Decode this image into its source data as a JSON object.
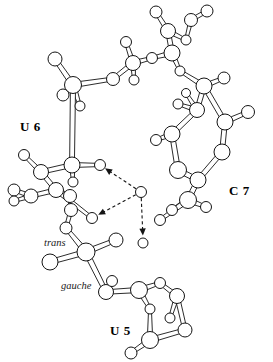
{
  "figure": {
    "kind": "molecular-structure-diagram",
    "style": "ball-and-stick ORTEP-like line drawing",
    "background_color": "#ffffff",
    "line_color": "#141414",
    "atom_fill_color": "#ffffff",
    "width": 273,
    "height": 362
  },
  "labels": {
    "residue_u6": "U 6",
    "residue_c7": "C 7",
    "residue_u5": "U 5",
    "conformer_trans": "trans",
    "conformer_gauche": "gauche"
  },
  "chart_data": {
    "type": "scatter",
    "title": "",
    "xlabel": "",
    "ylabel": "",
    "grid": false,
    "legend": false,
    "annotations": [
      {
        "text": "U 6",
        "x": 20,
        "y": 120,
        "style": "bold"
      },
      {
        "text": "C 7",
        "x": 229,
        "y": 184,
        "style": "bold"
      },
      {
        "text": "U 5",
        "x": 110,
        "y": 324,
        "style": "bold"
      },
      {
        "text": "trans",
        "x": 44,
        "y": 238,
        "style": "italic"
      },
      {
        "text": "gauche",
        "x": 61,
        "y": 281,
        "style": "italic"
      }
    ],
    "atoms": [
      {
        "id": "a1",
        "x": 55,
        "y": 59,
        "r": 7.0
      },
      {
        "id": "a2",
        "x": 73,
        "y": 85,
        "r": 8.5
      },
      {
        "id": "a3",
        "x": 63,
        "y": 95,
        "r": 6.0
      },
      {
        "id": "a4",
        "x": 80,
        "y": 106,
        "r": 5.0
      },
      {
        "id": "a5",
        "x": 113,
        "y": 79,
        "r": 6.5
      },
      {
        "id": "a6",
        "x": 133,
        "y": 63,
        "r": 7.5
      },
      {
        "id": "a7",
        "x": 126,
        "y": 42,
        "r": 5.5
      },
      {
        "id": "a8",
        "x": 134,
        "y": 80,
        "r": 5.0
      },
      {
        "id": "a9",
        "x": 152,
        "y": 58,
        "r": 5.5
      },
      {
        "id": "a10",
        "x": 172,
        "y": 53,
        "r": 8.0
      },
      {
        "id": "a11",
        "x": 168,
        "y": 31,
        "r": 7.5
      },
      {
        "id": "a12",
        "x": 156,
        "y": 12,
        "r": 6.0
      },
      {
        "id": "a13",
        "x": 186,
        "y": 40,
        "r": 5.0
      },
      {
        "id": "a14",
        "x": 191,
        "y": 20,
        "r": 6.5
      },
      {
        "id": "a15",
        "x": 207,
        "y": 11,
        "r": 6.0
      },
      {
        "id": "a16",
        "x": 180,
        "y": 71,
        "r": 5.0
      },
      {
        "id": "a17",
        "x": 204,
        "y": 86,
        "r": 8.0
      },
      {
        "id": "a18",
        "x": 224,
        "y": 78,
        "r": 6.0
      },
      {
        "id": "a19",
        "x": 197,
        "y": 110,
        "r": 7.5
      },
      {
        "id": "a20",
        "x": 178,
        "y": 104,
        "r": 5.0
      },
      {
        "id": "a21",
        "x": 186,
        "y": 93,
        "r": 4.5
      },
      {
        "id": "a22",
        "x": 225,
        "y": 122,
        "r": 8.0
      },
      {
        "id": "a23",
        "x": 248,
        "y": 112,
        "r": 6.5
      },
      {
        "id": "a24",
        "x": 172,
        "y": 134,
        "r": 8.0
      },
      {
        "id": "a25",
        "x": 156,
        "y": 140,
        "r": 5.5
      },
      {
        "id": "a26",
        "x": 222,
        "y": 152,
        "r": 8.0
      },
      {
        "id": "a27",
        "x": 178,
        "y": 170,
        "r": 8.5
      },
      {
        "id": "a28",
        "x": 198,
        "y": 180,
        "r": 8.0
      },
      {
        "id": "a29",
        "x": 188,
        "y": 200,
        "r": 8.5
      },
      {
        "id": "a30",
        "x": 172,
        "y": 210,
        "r": 5.5
      },
      {
        "id": "a31",
        "x": 206,
        "y": 207,
        "r": 5.5
      },
      {
        "id": "a32",
        "x": 160,
        "y": 220,
        "r": 5.5
      },
      {
        "id": "a33",
        "x": 141,
        "y": 192,
        "r": 5.5
      },
      {
        "id": "a34",
        "x": 100,
        "y": 165,
        "r": 5.5
      },
      {
        "id": "a35",
        "x": 92,
        "y": 218,
        "r": 5.5
      },
      {
        "id": "a36",
        "x": 143,
        "y": 243,
        "r": 5.0
      },
      {
        "id": "a37",
        "x": 72,
        "y": 165,
        "r": 8.0
      },
      {
        "id": "a38",
        "x": 41,
        "y": 172,
        "r": 7.5
      },
      {
        "id": "a39",
        "x": 24,
        "y": 155,
        "r": 5.5
      },
      {
        "id": "a40",
        "x": 56,
        "y": 190,
        "r": 7.5
      },
      {
        "id": "a41",
        "x": 70,
        "y": 196,
        "r": 6.5
      },
      {
        "id": "a42",
        "x": 31,
        "y": 196,
        "r": 7.0
      },
      {
        "id": "a43",
        "x": 14,
        "y": 190,
        "r": 6.0
      },
      {
        "id": "a44",
        "x": 14,
        "y": 201,
        "r": 5.0
      },
      {
        "id": "a45",
        "x": 73,
        "y": 182,
        "r": 5.0
      },
      {
        "id": "a46",
        "x": 71,
        "y": 210,
        "r": 6.5
      },
      {
        "id": "a47",
        "x": 66,
        "y": 228,
        "r": 6.0
      },
      {
        "id": "a48",
        "x": 86,
        "y": 252,
        "r": 9.0
      },
      {
        "id": "a49",
        "x": 50,
        "y": 262,
        "r": 8.0
      },
      {
        "id": "a50",
        "x": 116,
        "y": 240,
        "r": 7.0
      },
      {
        "id": "a51",
        "x": 106,
        "y": 292,
        "r": 7.5
      },
      {
        "id": "a52",
        "x": 112,
        "y": 281,
        "r": 5.5
      },
      {
        "id": "a53",
        "x": 139,
        "y": 290,
        "r": 8.5
      },
      {
        "id": "a54",
        "x": 160,
        "y": 283,
        "r": 5.5
      },
      {
        "id": "a55",
        "x": 150,
        "y": 309,
        "r": 5.0
      },
      {
        "id": "a56",
        "x": 177,
        "y": 296,
        "r": 7.5
      },
      {
        "id": "a57",
        "x": 170,
        "y": 318,
        "r": 5.0
      },
      {
        "id": "a58",
        "x": 185,
        "y": 330,
        "r": 7.0
      },
      {
        "id": "a59",
        "x": 150,
        "y": 340,
        "r": 8.5
      },
      {
        "id": "a60",
        "x": 131,
        "y": 353,
        "r": 6.0
      }
    ],
    "bonds": [
      [
        "a1",
        "a2"
      ],
      [
        "a2",
        "a3"
      ],
      [
        "a2",
        "a4"
      ],
      [
        "a2",
        "a5"
      ],
      [
        "a5",
        "a6"
      ],
      [
        "a6",
        "a7"
      ],
      [
        "a6",
        "a8"
      ],
      [
        "a6",
        "a9"
      ],
      [
        "a9",
        "a10"
      ],
      [
        "a10",
        "a11"
      ],
      [
        "a11",
        "a12"
      ],
      [
        "a11",
        "a13"
      ],
      [
        "a13",
        "a14"
      ],
      [
        "a14",
        "a15"
      ],
      [
        "a10",
        "a16"
      ],
      [
        "a16",
        "a17"
      ],
      [
        "a17",
        "a18"
      ],
      [
        "a17",
        "a19"
      ],
      [
        "a19",
        "a20"
      ],
      [
        "a19",
        "a21"
      ],
      [
        "a17",
        "a22"
      ],
      [
        "a22",
        "a23"
      ],
      [
        "a19",
        "a24"
      ],
      [
        "a24",
        "a25"
      ],
      [
        "a22",
        "a26"
      ],
      [
        "a24",
        "a27"
      ],
      [
        "a27",
        "a28"
      ],
      [
        "a28",
        "a26"
      ],
      [
        "a28",
        "a29"
      ],
      [
        "a29",
        "a30"
      ],
      [
        "a29",
        "a31"
      ],
      [
        "a29",
        "a32"
      ],
      [
        "a2",
        "a37"
      ],
      [
        "a37",
        "a38"
      ],
      [
        "a38",
        "a39"
      ],
      [
        "a38",
        "a40"
      ],
      [
        "a40",
        "a41"
      ],
      [
        "a40",
        "a42"
      ],
      [
        "a42",
        "a43"
      ],
      [
        "a42",
        "a44"
      ],
      [
        "a37",
        "a45"
      ],
      [
        "a41",
        "a46"
      ],
      [
        "a46",
        "a47"
      ],
      [
        "a47",
        "a48"
      ],
      [
        "a48",
        "a49"
      ],
      [
        "a48",
        "a50"
      ],
      [
        "a48",
        "a51"
      ],
      [
        "a51",
        "a52"
      ],
      [
        "a51",
        "a53"
      ],
      [
        "a53",
        "a54"
      ],
      [
        "a53",
        "a55"
      ],
      [
        "a54",
        "a56"
      ],
      [
        "a56",
        "a57"
      ],
      [
        "a56",
        "a58"
      ],
      [
        "a58",
        "a59"
      ],
      [
        "a59",
        "a60"
      ],
      [
        "a55",
        "a59"
      ],
      [
        "a34",
        "a37"
      ],
      [
        "a35",
        "a40"
      ]
    ],
    "hydrogen_bonds": [
      {
        "from": "a33",
        "to": "a34",
        "from_x": 141,
        "from_y": 192,
        "to_x": 103,
        "to_y": 167
      },
      {
        "from": "a33",
        "to": "a35",
        "from_x": 141,
        "from_y": 192,
        "to_x": 96,
        "to_y": 216
      },
      {
        "from": "a33",
        "to": "a36",
        "from_x": 141,
        "from_y": 192,
        "to_x": 143,
        "to_y": 238
      }
    ]
  }
}
